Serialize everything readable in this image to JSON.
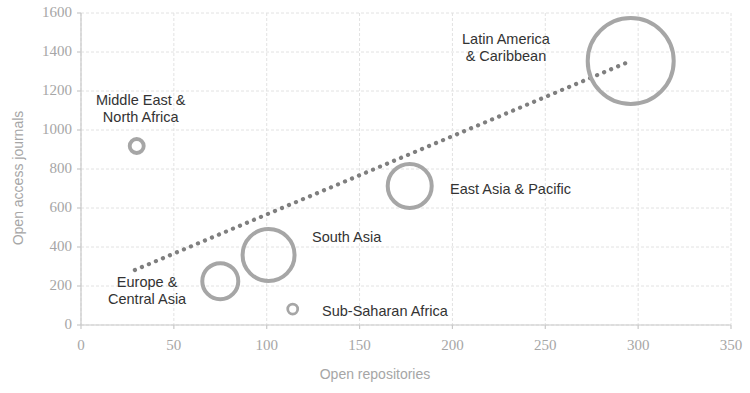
{
  "chart_data": {
    "type": "scatter",
    "title": "",
    "xlabel": "Open repositories",
    "ylabel": "Open access journals",
    "xlim": [
      0,
      350
    ],
    "ylim": [
      0,
      1600
    ],
    "xticks": [
      "0",
      "50",
      "100",
      "150",
      "200",
      "250",
      "300",
      "350"
    ],
    "yticks": [
      "0",
      "200",
      "400",
      "600",
      "800",
      "1000",
      "1200",
      "1400",
      "1600"
    ],
    "grid": true,
    "legend": "none",
    "bubble_color": "#a6a6a6",
    "trendline": {
      "style": "dotted",
      "color": "#7f7f7f",
      "x_start": 29,
      "y_start": 282,
      "x_end": 296,
      "y_end": 1354
    },
    "points": [
      {
        "label": "Middle East &\nNorth Africa",
        "x": 30,
        "y": 918,
        "radius_px": 7,
        "label_x": 96,
        "label_y": 92
      },
      {
        "label": "Latin America\n& Caribbean",
        "x": 296,
        "y": 1354,
        "radius_px": 43,
        "label_x": 462,
        "label_y": 31
      },
      {
        "label": "East Asia & Pacific",
        "x": 177,
        "y": 713,
        "radius_px": 22,
        "label_x": 450,
        "label_y": 181
      },
      {
        "label": "South Asia",
        "x": 101,
        "y": 359,
        "radius_px": 26,
        "label_x": 312,
        "label_y": 229
      },
      {
        "label": "Europe &\nCentral Asia",
        "x": 75,
        "y": 225,
        "radius_px": 18,
        "label_x": 108,
        "label_y": 274
      },
      {
        "label": "Sub-Saharan Africa",
        "x": 114,
        "y": 82,
        "radius_px": 5,
        "label_x": 322,
        "label_y": 303
      }
    ]
  }
}
